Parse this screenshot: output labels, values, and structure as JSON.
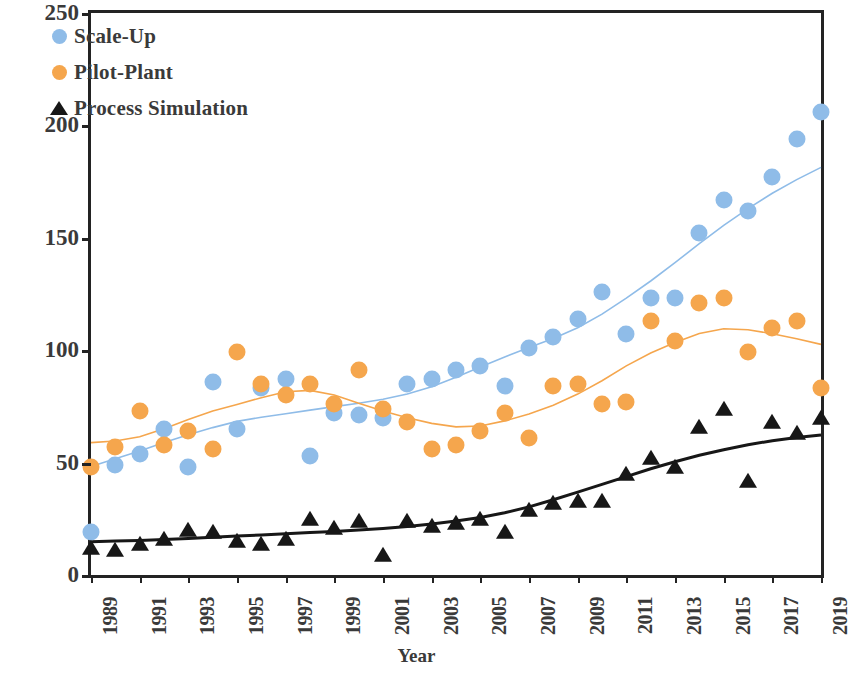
{
  "chart_data": {
    "type": "scatter",
    "title": "",
    "xlabel": "Year",
    "ylabel": "Number of Publications",
    "xlim": [
      1989,
      2019
    ],
    "ylim": [
      0,
      250
    ],
    "ytick_labels": [
      "0",
      "50",
      "100",
      "150",
      "200",
      "250"
    ],
    "ytick_values": [
      0,
      50,
      100,
      150,
      200,
      250
    ],
    "xtick_labels": [
      "1989",
      "1991",
      "1993",
      "1995",
      "1997",
      "1999",
      "2001",
      "2003",
      "2005",
      "2007",
      "2009",
      "2011",
      "2013",
      "2015",
      "2017",
      "2019"
    ],
    "xtick_values": [
      1989,
      1991,
      1993,
      1995,
      1997,
      1999,
      2001,
      2003,
      2005,
      2007,
      2009,
      2011,
      2013,
      2015,
      2017,
      2019
    ],
    "grid": false,
    "legend_position": "top-left",
    "x": [
      1989,
      1990,
      1991,
      1992,
      1993,
      1994,
      1995,
      1996,
      1997,
      1998,
      1999,
      2000,
      2001,
      2002,
      2003,
      2004,
      2005,
      2006,
      2007,
      2008,
      2009,
      2010,
      2011,
      2012,
      2013,
      2014,
      2015,
      2016,
      2017,
      2018,
      2019
    ],
    "series": [
      {
        "name": "Scale-Up",
        "marker": "circle",
        "color": "#8fbce8",
        "trendline": true,
        "values": [
          19,
          49,
          54,
          65,
          48,
          86,
          65,
          83,
          87,
          53,
          72,
          71,
          70,
          85,
          87,
          91,
          93,
          84,
          101,
          106,
          114,
          126,
          107,
          123,
          123,
          152,
          167,
          162,
          177,
          194,
          206
        ]
      },
      {
        "name": "Pilot-Plant",
        "marker": "circle",
        "color": "#f5a64d",
        "trendline": true,
        "values": [
          48,
          57,
          73,
          58,
          64,
          56,
          99,
          85,
          80,
          85,
          76,
          91,
          74,
          68,
          56,
          58,
          64,
          72,
          61,
          84,
          85,
          76,
          77,
          113,
          104,
          121,
          123,
          99,
          110,
          113,
          83
        ]
      },
      {
        "name": "Process Simulation",
        "marker": "triangle",
        "color": "#171717",
        "trendline": true,
        "values": [
          12,
          11,
          14,
          16,
          20,
          19,
          15,
          14,
          16,
          25,
          21,
          24,
          9,
          24,
          22,
          23,
          25,
          19,
          29,
          32,
          33,
          33,
          45,
          52,
          48,
          66,
          74,
          42,
          68,
          63,
          70
        ]
      }
    ]
  },
  "legend": {
    "items": [
      {
        "label": "Scale-Up",
        "marker": "circle-blue"
      },
      {
        "label": "Pilot-Plant",
        "marker": "circle-orange"
      },
      {
        "label": "Process Simulation",
        "marker": "triangle-black"
      }
    ]
  },
  "axes": {
    "x_title": "Year",
    "y_title": "Number of Publications"
  },
  "colors": {
    "scaleup": "#8fbce8",
    "pilot": "#f5a64d",
    "simulation": "#171717",
    "axis": "#232323",
    "text": "#3a3a3a"
  }
}
